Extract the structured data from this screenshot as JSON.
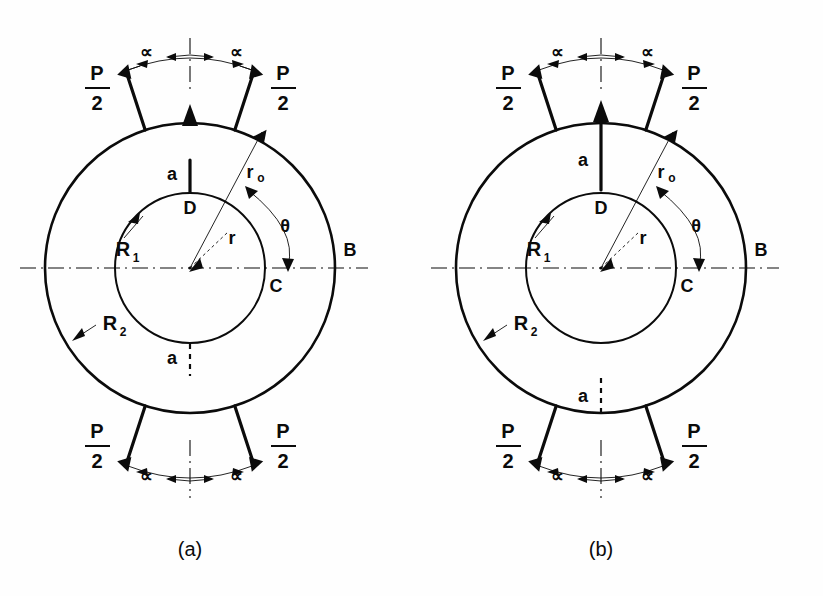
{
  "figure": {
    "background_color": "#fefefe",
    "ink_color": "#0b0b0b"
  },
  "panels": [
    {
      "id": "a",
      "caption": "(a)",
      "geometry": {
        "cx": 190,
        "cy": 268,
        "outer_radius": 145,
        "inner_radius": 75,
        "load_half_angle_deg": 18,
        "force_arrow_length": 62
      },
      "labels": {
        "force_top_left": {
          "num": "P",
          "den": "2"
        },
        "force_top_right": {
          "num": "P",
          "den": "2"
        },
        "force_bottom_left": {
          "num": "P",
          "den": "2"
        },
        "force_bottom_right": {
          "num": "P",
          "den": "2"
        },
        "alpha_top_left": "∝",
        "alpha_top_right": "∝",
        "alpha_bottom_left": "∝",
        "alpha_bottom_right": "∝",
        "axis_marker_A": "A",
        "axis_marker_B": "B",
        "axis_marker_C": "C",
        "axis_marker_D": "D",
        "section_top": "a",
        "section_bottom": "a",
        "radius_inner": "R",
        "radius_inner_sub": "1",
        "radius_outer": "R",
        "radius_outer_sub": "2",
        "radius_ro": "r",
        "radius_ro_sub": "o",
        "radius_r": "r",
        "angle_theta": "θ"
      }
    },
    {
      "id": "b",
      "caption": "(b)",
      "geometry": {
        "cx": 190,
        "cy": 268,
        "outer_radius": 145,
        "inner_radius": 75,
        "load_half_angle_deg": 18,
        "force_arrow_length": 62
      },
      "labels": {
        "force_top_left": {
          "num": "P",
          "den": "2"
        },
        "force_top_right": {
          "num": "P",
          "den": "2"
        },
        "force_bottom_left": {
          "num": "P",
          "den": "2"
        },
        "force_bottom_right": {
          "num": "P",
          "den": "2"
        },
        "alpha_top_left": "∝",
        "alpha_top_right": "∝",
        "alpha_bottom_left": "∝",
        "alpha_bottom_right": "∝",
        "axis_marker_A": "A",
        "axis_marker_B": "B",
        "axis_marker_C": "C",
        "axis_marker_D": "D",
        "section_top": "a",
        "section_bottom": "a",
        "radius_inner": "R",
        "radius_inner_sub": "1",
        "radius_outer": "R",
        "radius_outer_sub": "2",
        "radius_ro": "r",
        "radius_ro_sub": "o",
        "radius_r": "r",
        "angle_theta": "θ"
      }
    }
  ]
}
